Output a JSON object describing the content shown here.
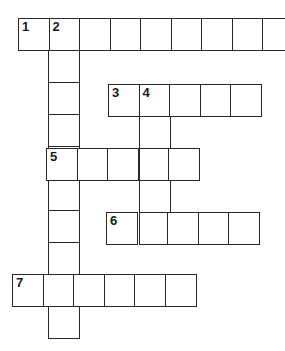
{
  "puzzle": {
    "type": "crossword",
    "cell_size": 31,
    "colors": {
      "border": "#2a2a2a",
      "background": "#ffffff",
      "number": "#1a1a1a"
    },
    "entries": [
      {
        "number": "1",
        "direction": "across",
        "x": 18,
        "y": 18,
        "length": 9
      },
      {
        "number": "2",
        "direction": "down",
        "x": 48,
        "y": 18,
        "length": 10
      },
      {
        "number": "3",
        "direction": "across",
        "x": 108,
        "y": 84,
        "length": 5
      },
      {
        "number": "4",
        "direction": "down",
        "x": 139,
        "y": 84,
        "length": 5
      },
      {
        "number": "5",
        "direction": "across",
        "x": 46,
        "y": 148,
        "length": 5
      },
      {
        "number": "6",
        "direction": "across",
        "x": 106,
        "y": 212,
        "length": 5
      },
      {
        "number": "7",
        "direction": "across",
        "x": 12,
        "y": 274,
        "length": 6
      }
    ]
  }
}
